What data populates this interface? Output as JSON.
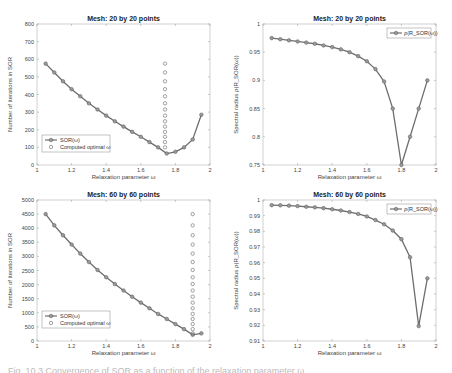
{
  "chart_data": [
    {
      "id": "tl",
      "type": "line",
      "title": "Mesh:  20 by 20 points",
      "xlabel": "Relaxation parameter  ω",
      "ylabel": "Number of iterations in SOR",
      "xlim": [
        1,
        2
      ],
      "ylim": [
        0,
        800
      ],
      "xticks": [
        1,
        1.2,
        1.4,
        1.6,
        1.8,
        2
      ],
      "yticks": [
        0,
        100,
        200,
        300,
        400,
        500,
        600,
        700,
        800
      ],
      "legend": {
        "position": "lower-left",
        "entries": [
          "SOR(ω)",
          "Computed optimal  ω"
        ]
      },
      "series": [
        {
          "name": "SOR(ω)",
          "style": "line-marker",
          "x": [
            1.05,
            1.1,
            1.15,
            1.2,
            1.25,
            1.3,
            1.35,
            1.4,
            1.45,
            1.5,
            1.55,
            1.6,
            1.65,
            1.7,
            1.75,
            1.8,
            1.85,
            1.9,
            1.95
          ],
          "values": [
            575,
            525,
            475,
            430,
            390,
            350,
            315,
            280,
            248,
            218,
            188,
            160,
            130,
            100,
            65,
            75,
            100,
            145,
            285
          ]
        },
        {
          "name": "Computed optimal  ω",
          "style": "marker-only",
          "x_const": 1.74,
          "values": [
            100,
            130,
            160,
            188,
            218,
            248,
            280,
            315,
            350,
            390,
            430,
            475,
            525,
            575
          ]
        }
      ]
    },
    {
      "id": "tr",
      "type": "line",
      "title": "Mesh:  20 by 20 points",
      "xlabel": "Relaxation parameter  ω",
      "ylabel": "Spectral radius  ρ(R_SOR(ω))",
      "xlim": [
        1,
        2
      ],
      "ylim": [
        0.75,
        1
      ],
      "xticks": [
        1,
        1.2,
        1.4,
        1.6,
        1.8,
        2
      ],
      "yticks": [
        0.75,
        0.8,
        0.85,
        0.9,
        0.95,
        1
      ],
      "legend": {
        "position": "upper-right",
        "entries": [
          "ρ(R_SOR(ω))"
        ]
      },
      "series": [
        {
          "name": "ρ(R_SOR(ω))",
          "style": "line-marker",
          "x": [
            1.05,
            1.1,
            1.15,
            1.2,
            1.25,
            1.3,
            1.35,
            1.4,
            1.45,
            1.5,
            1.55,
            1.6,
            1.65,
            1.7,
            1.75,
            1.8,
            1.85,
            1.9,
            1.95
          ],
          "values": [
            0.975,
            0.973,
            0.971,
            0.969,
            0.967,
            0.965,
            0.962,
            0.959,
            0.955,
            0.95,
            0.943,
            0.934,
            0.92,
            0.898,
            0.85,
            0.75,
            0.8,
            0.85,
            0.9,
            0.95
          ]
        }
      ]
    },
    {
      "id": "bl",
      "type": "line",
      "title": "Mesh:  60 by 60 points",
      "xlabel": "Relaxation parameter  ω",
      "ylabel": "Number of iterations in SOR",
      "xlim": [
        1,
        2
      ],
      "ylim": [
        0,
        5000
      ],
      "xticks": [
        1,
        1.2,
        1.4,
        1.6,
        1.8,
        2
      ],
      "yticks": [
        0,
        500,
        1000,
        1500,
        2000,
        2500,
        3000,
        3500,
        4000,
        4500,
        5000
      ],
      "legend": {
        "position": "lower-left",
        "entries": [
          "SOR(ω)",
          "Computed optimal  ω"
        ]
      },
      "series": [
        {
          "name": "SOR(ω)",
          "style": "line-marker",
          "x": [
            1.05,
            1.1,
            1.15,
            1.2,
            1.25,
            1.3,
            1.35,
            1.4,
            1.45,
            1.5,
            1.55,
            1.6,
            1.65,
            1.7,
            1.75,
            1.8,
            1.85,
            1.9,
            1.95
          ],
          "values": [
            4500,
            4100,
            3750,
            3420,
            3100,
            2800,
            2520,
            2260,
            2020,
            1790,
            1570,
            1360,
            1160,
            960,
            780,
            600,
            420,
            220,
            270
          ]
        },
        {
          "name": "Computed optimal  ω",
          "style": "marker-only",
          "x_const": 1.9,
          "values": [
            270,
            420,
            600,
            780,
            960,
            1160,
            1360,
            1570,
            1790,
            2020,
            2260,
            2520,
            2800,
            3100,
            3420,
            3750,
            4100,
            4500
          ]
        }
      ]
    },
    {
      "id": "br",
      "type": "line",
      "title": "Mesh:  60 by 60 points",
      "xlabel": "Relaxation parameter  ω",
      "ylabel": "Spectral radius  ρ(R_SOR(ω))",
      "xlim": [
        1,
        2
      ],
      "ylim": [
        0.91,
        1
      ],
      "xticks": [
        1,
        1.2,
        1.4,
        1.6,
        1.8,
        2
      ],
      "yticks": [
        0.91,
        0.92,
        0.93,
        0.94,
        0.95,
        0.96,
        0.97,
        0.98,
        0.99,
        1
      ],
      "legend": {
        "position": "upper-right",
        "entries": [
          "ρ(R_SOR(ω))"
        ]
      },
      "series": [
        {
          "name": "ρ(R_SOR(ω))",
          "style": "line-marker",
          "x": [
            1.05,
            1.1,
            1.15,
            1.2,
            1.25,
            1.3,
            1.35,
            1.4,
            1.45,
            1.5,
            1.55,
            1.6,
            1.65,
            1.7,
            1.75,
            1.8,
            1.85,
            1.9,
            1.95
          ],
          "values": [
            0.9967,
            0.9966,
            0.9964,
            0.9961,
            0.9957,
            0.9953,
            0.9948,
            0.9941,
            0.9933,
            0.9923,
            0.9911,
            0.9895,
            0.9872,
            0.9845,
            0.9805,
            0.975,
            0.9635,
            0.9195,
            0.95
          ]
        }
      ]
    }
  ],
  "caption": "Fig. 10.3  Convergence of SOR as a function of the relaxation parameter ω"
}
